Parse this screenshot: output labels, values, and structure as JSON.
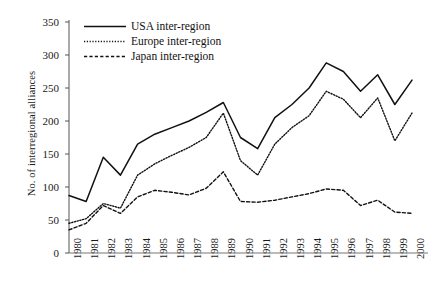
{
  "chart_data": {
    "type": "line",
    "title": "",
    "xlabel": "",
    "ylabel": "No. of interregional alliances",
    "categories": [
      "1980",
      "1981",
      "1982",
      "1983",
      "1984",
      "1985",
      "1986",
      "1987",
      "1988",
      "1989",
      "1990",
      "1991",
      "1992",
      "1993",
      "1994",
      "1995",
      "1996",
      "1997",
      "1998",
      "1999",
      "2000"
    ],
    "x": [
      1980,
      1981,
      1982,
      1983,
      1984,
      1985,
      1986,
      1987,
      1988,
      1989,
      1990,
      1991,
      1992,
      1993,
      1994,
      1995,
      1996,
      1997,
      1998,
      1999,
      2000
    ],
    "ylim": [
      0,
      350
    ],
    "xlim": [
      1980,
      2000
    ],
    "yticks": [
      0,
      50,
      100,
      150,
      200,
      250,
      300,
      350
    ],
    "grid": false,
    "legend_position": "top-left",
    "series": [
      {
        "name": "USA inter-region",
        "style": "solid",
        "color": "#111111",
        "values": [
          87,
          78,
          145,
          118,
          165,
          180,
          190,
          200,
          213,
          228,
          175,
          158,
          205,
          225,
          250,
          288,
          275,
          245,
          270,
          225,
          262
        ]
      },
      {
        "name": "Europe inter-region",
        "style": "dotted",
        "color": "#111111",
        "values": [
          45,
          52,
          75,
          68,
          118,
          135,
          148,
          160,
          175,
          212,
          140,
          118,
          165,
          190,
          208,
          245,
          233,
          205,
          235,
          170,
          212
        ]
      },
      {
        "name": "Japan inter-region",
        "style": "dashed",
        "color": "#111111",
        "values": [
          35,
          45,
          72,
          60,
          85,
          95,
          92,
          88,
          98,
          123,
          78,
          77,
          80,
          85,
          90,
          97,
          95,
          72,
          80,
          62,
          60
        ]
      }
    ]
  },
  "axes": {
    "y_tick_labels": [
      "350",
      "300",
      "250",
      "200",
      "150",
      "100",
      "50",
      "0"
    ],
    "y_title": "No. of interregional alliances",
    "x_tick_labels": [
      "1980",
      "1981",
      "1982",
      "1983",
      "1984",
      "1985",
      "1986",
      "1987",
      "1988",
      "1989",
      "1990",
      "1991",
      "1992",
      "1993",
      "1994",
      "1995",
      "1996",
      "1997",
      "1998",
      "1999",
      "2000"
    ]
  },
  "legend": {
    "items": [
      {
        "label": "USA inter-region",
        "style": "solid"
      },
      {
        "label": "Europe inter-region",
        "style": "dotted"
      },
      {
        "label": "Japan inter-region",
        "style": "dashed"
      }
    ]
  }
}
